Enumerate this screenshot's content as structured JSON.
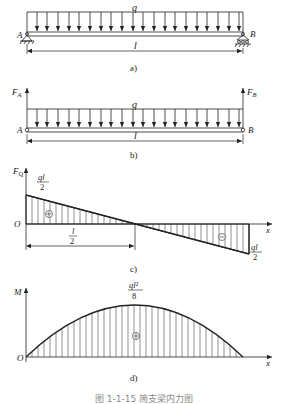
{
  "figure": {
    "caption": "图 1-1-15 简支梁内力图",
    "panels": {
      "a": {
        "label": "a)",
        "load_label": "q",
        "support_left": "A",
        "support_right": "B",
        "span_label": "l"
      },
      "b": {
        "label": "b)",
        "load_label": "q",
        "reaction_left": "F",
        "reaction_left_sub": "A",
        "reaction_right": "F",
        "reaction_right_sub": "B",
        "node_left": "A",
        "node_right": "B",
        "span_label": "l"
      },
      "c": {
        "label": "c)",
        "axis_y": "F",
        "axis_y_sub": "Q",
        "axis_x": "x",
        "origin": "O",
        "left_value_num": "ql",
        "left_value_den": "2",
        "right_value_num": "ql",
        "right_value_den": "2",
        "half_span_num": "l",
        "half_span_den": "2",
        "sign_positive": "+",
        "sign_negative": "−"
      },
      "d": {
        "label": "d)",
        "axis_y": "M",
        "axis_x": "x",
        "origin": "O",
        "peak_value_num": "ql²",
        "peak_value_den": "8",
        "sign_positive": "+"
      }
    }
  }
}
